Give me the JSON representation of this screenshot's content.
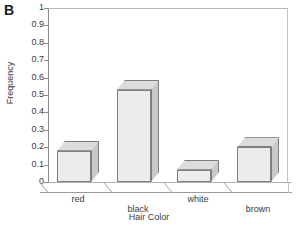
{
  "figure": {
    "panel_letter": "B",
    "background_color": "#ffffff",
    "bar_face_color": "#ececed",
    "bar_side_color": "#c9c9c9",
    "bar_top_color": "#dcdcdc",
    "axis_color": "#8c8c8c",
    "text_color": "#3a3a3a"
  },
  "chart_data": {
    "type": "bar",
    "title": "",
    "subtitle": "",
    "xlabel": "Hair Color",
    "ylabel": "Frequency",
    "categories": [
      "red",
      "black",
      "white",
      "brown"
    ],
    "values": [
      0.18,
      0.53,
      0.07,
      0.2
    ],
    "series": [
      {
        "name": "Frequency",
        "values": [
          0.18,
          0.53,
          0.07,
          0.2
        ]
      }
    ],
    "ylim": [
      0,
      1
    ],
    "ytick_values": [
      1,
      0.9,
      0.8,
      0.7,
      0.6,
      0.5,
      0.4,
      0.3,
      0.2,
      0.1,
      0
    ],
    "ytick_labels": [
      "1",
      "0.9",
      "0.8",
      "0.7",
      "0.6",
      "0.5",
      "0.4",
      "0.3",
      "0.2",
      "0.1",
      "0"
    ],
    "grid": false,
    "legend": null,
    "legend_position": "none",
    "style_3d": true,
    "annotations": []
  },
  "yticks": [
    {
      "label": "1",
      "value": 1.0
    },
    {
      "label": "0.9",
      "value": 0.9
    },
    {
      "label": "0.8",
      "value": 0.8
    },
    {
      "label": "0.7",
      "value": 0.7
    },
    {
      "label": "0.6",
      "value": 0.6
    },
    {
      "label": "0.5",
      "value": 0.5
    },
    {
      "label": "0.4",
      "value": 0.4
    },
    {
      "label": "0.3",
      "value": 0.3
    },
    {
      "label": "0.2",
      "value": 0.2
    },
    {
      "label": "0.1",
      "value": 0.1
    },
    {
      "label": "0",
      "value": 0.0
    }
  ],
  "bars": [
    {
      "label": "red",
      "value": 0.18,
      "label_row": 0
    },
    {
      "label": "black",
      "value": 0.53,
      "label_row": 1
    },
    {
      "label": "white",
      "value": 0.07,
      "label_row": 0
    },
    {
      "label": "brown",
      "value": 0.2,
      "label_row": 1
    }
  ]
}
